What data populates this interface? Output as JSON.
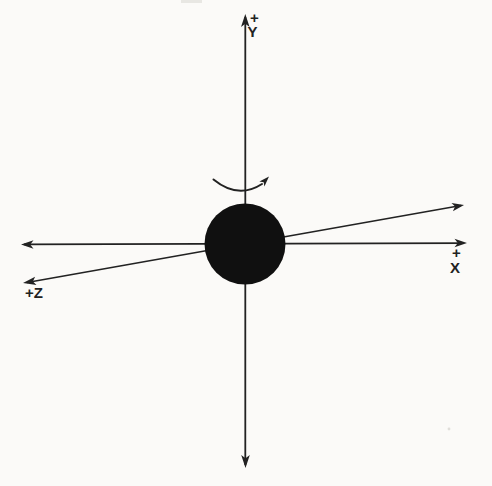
{
  "diagram": {
    "type": "coordinate-axes-with-sphere",
    "labels": {
      "y_sign": "+",
      "y_axis": "Y",
      "x_sign": "+",
      "x_axis": "X",
      "z_axis": "+Z"
    },
    "colors": {
      "background": "#fbfaf8",
      "ink": "#222222",
      "sphere": "#101010",
      "artifact": "#d9d7d2"
    }
  }
}
